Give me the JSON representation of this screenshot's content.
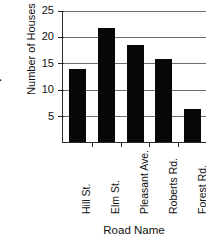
{
  "figure": {
    "list_marker": "l."
  },
  "chart_data": {
    "type": "bar",
    "title": "",
    "xlabel": "Road Name",
    "ylabel": "Number of Houses",
    "categories": [
      "Hill St.",
      "Elm St.",
      "Pleasant Ave.",
      "Roberts Rd.",
      "Forest Rd."
    ],
    "values": [
      13.8,
      21.5,
      18.3,
      15.7,
      6.2
    ],
    "ylim": [
      0,
      25
    ],
    "yticks": [
      5,
      10,
      15,
      20,
      25
    ],
    "ytick_labels": [
      "5",
      "10",
      "15",
      "20",
      "25"
    ],
    "grid": true,
    "legend": false,
    "bar_color": "#070707",
    "axis_color": "#2a2a2a",
    "grid_color": "#6e6e6e"
  }
}
